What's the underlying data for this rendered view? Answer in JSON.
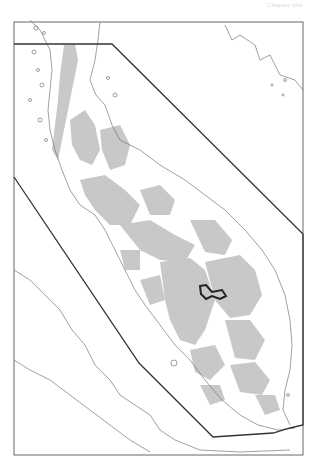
{
  "header": {
    "running_title": "Chapter title"
  },
  "map": {
    "frame": {
      "x": 14,
      "y": 22,
      "width": 289,
      "height": 433
    },
    "colors": {
      "background": "#ffffff",
      "frame": "#666666",
      "coastline": "#777777",
      "land_highlands": "#c8c8c8",
      "study_boundary": "#333333",
      "protected_area": "#222222"
    },
    "study_polygon": [
      [
        14,
        44
      ],
      [
        112,
        44
      ],
      [
        303,
        234
      ],
      [
        303,
        425
      ],
      [
        290,
        428
      ],
      [
        273,
        433
      ],
      [
        213,
        437
      ],
      [
        139,
        363
      ],
      [
        14,
        177
      ]
    ],
    "protected_area_label": "protected-area-outline"
  }
}
